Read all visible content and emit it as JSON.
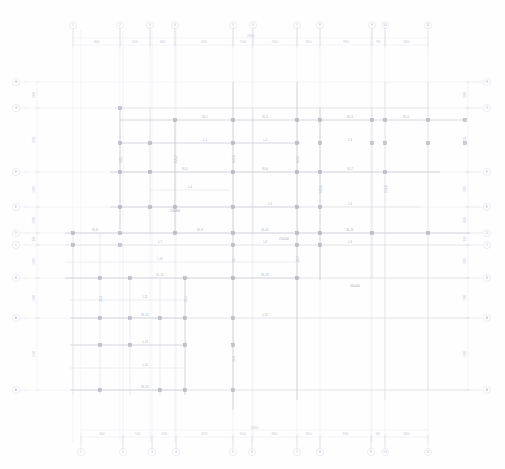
{
  "document": {
    "type": "structural-framing-plan",
    "title": "",
    "background_color": "#fefeff",
    "axis_line_color": "#e6e6ec",
    "beam_line_color": "#cfcfd8",
    "heavy_beam_color": "#b9b9c4",
    "column_color": "#9a9aa8",
    "bubble_stroke_color": "#d8d8e0",
    "dim_text_color": "#c9c9d2",
    "beam_text_color": "#a8a8b4"
  },
  "grid": {
    "top_bubbles": [
      {
        "label": "1",
        "x": 73
      },
      {
        "label": "2",
        "x": 120
      },
      {
        "label": "3",
        "x": 150
      },
      {
        "label": "4",
        "x": 175
      },
      {
        "label": "5",
        "x": 233
      },
      {
        "label": "6",
        "x": 253
      },
      {
        "label": "7",
        "x": 297
      },
      {
        "label": "8",
        "x": 320
      },
      {
        "label": "9",
        "x": 372
      },
      {
        "label": "10",
        "x": 385
      },
      {
        "label": "11",
        "x": 428
      }
    ],
    "bottom_bubbles": [
      {
        "label": "1",
        "x": 81
      },
      {
        "label": "2",
        "x": 123
      },
      {
        "label": "3",
        "x": 152
      },
      {
        "label": "4",
        "x": 176
      },
      {
        "label": "5",
        "x": 233
      },
      {
        "label": "6",
        "x": 252
      },
      {
        "label": "7",
        "x": 297
      },
      {
        "label": "8",
        "x": 320
      },
      {
        "label": "9",
        "x": 371
      },
      {
        "label": "10",
        "x": 385
      },
      {
        "label": "11",
        "x": 428
      }
    ],
    "left_bubbles": [
      {
        "label": "H",
        "y": 82
      },
      {
        "label": "G",
        "y": 108
      },
      {
        "label": "F",
        "y": 172
      },
      {
        "label": "E",
        "y": 207
      },
      {
        "label": "D",
        "y": 233
      },
      {
        "label": "C",
        "y": 245
      },
      {
        "label": "B",
        "y": 278
      },
      {
        "label": "A",
        "y": 318
      },
      {
        "label": "A",
        "y": 390
      }
    ],
    "right_bubbles": [
      {
        "label": "H",
        "y": 82
      },
      {
        "label": "G",
        "y": 108
      },
      {
        "label": "F",
        "y": 172
      },
      {
        "label": "E",
        "y": 207
      },
      {
        "label": "D",
        "y": 233
      },
      {
        "label": "C",
        "y": 245
      },
      {
        "label": "B",
        "y": 278
      },
      {
        "label": "A",
        "y": 318
      },
      {
        "label": "A",
        "y": 390
      }
    ]
  },
  "dimensions": {
    "top_chain": [
      {
        "value": "3600",
        "x1": 73,
        "x2": 120
      },
      {
        "value": "2100",
        "x1": 120,
        "x2": 150
      },
      {
        "value": "1800",
        "x1": 150,
        "x2": 175
      },
      {
        "value": "4200",
        "x1": 175,
        "x2": 233
      },
      {
        "value": "1500",
        "x1": 233,
        "x2": 253
      },
      {
        "value": "3300",
        "x1": 253,
        "x2": 297
      },
      {
        "value": "1800",
        "x1": 297,
        "x2": 320
      },
      {
        "value": "3900",
        "x1": 320,
        "x2": 372
      },
      {
        "value": "900",
        "x1": 372,
        "x2": 385
      },
      {
        "value": "3300",
        "x1": 385,
        "x2": 428
      }
    ],
    "top_overall": {
      "value": "25800",
      "x1": 73,
      "x2": 428
    },
    "bottom_chain": [
      {
        "value": "3600",
        "x1": 81,
        "x2": 123
      },
      {
        "value": "2100",
        "x1": 123,
        "x2": 152
      },
      {
        "value": "1800",
        "x1": 152,
        "x2": 176
      },
      {
        "value": "4200",
        "x1": 176,
        "x2": 233
      },
      {
        "value": "1500",
        "x1": 233,
        "x2": 252
      },
      {
        "value": "3300",
        "x1": 252,
        "x2": 297
      },
      {
        "value": "1800",
        "x1": 297,
        "x2": 320
      },
      {
        "value": "3900",
        "x1": 320,
        "x2": 371
      },
      {
        "value": "900",
        "x1": 371,
        "x2": 385
      },
      {
        "value": "3300",
        "x1": 385,
        "x2": 428
      }
    ],
    "bottom_overall": {
      "value": "25800",
      "x1": 81,
      "x2": 428
    },
    "left_chain": [
      {
        "value": "1800",
        "y1": 82,
        "y2": 108
      },
      {
        "value": "4500",
        "y1": 108,
        "y2": 172
      },
      {
        "value": "2400",
        "y1": 172,
        "y2": 207
      },
      {
        "value": "1800",
        "y1": 207,
        "y2": 233
      },
      {
        "value": "900",
        "y1": 233,
        "y2": 245
      },
      {
        "value": "2400",
        "y1": 245,
        "y2": 278
      },
      {
        "value": "2700",
        "y1": 278,
        "y2": 318
      },
      {
        "value": "5100",
        "y1": 318,
        "y2": 390
      }
    ],
    "right_chain": [
      {
        "value": "1800",
        "y1": 82,
        "y2": 108
      },
      {
        "value": "4500",
        "y1": 108,
        "y2": 172
      },
      {
        "value": "2400",
        "y1": 172,
        "y2": 207
      },
      {
        "value": "1800",
        "y1": 207,
        "y2": 233
      },
      {
        "value": "900",
        "y1": 233,
        "y2": 245
      },
      {
        "value": "2400",
        "y1": 245,
        "y2": 278
      },
      {
        "value": "2700",
        "y1": 278,
        "y2": 318
      },
      {
        "value": "5100",
        "y1": 318,
        "y2": 390
      }
    ]
  },
  "axes": {
    "vertical_x": [
      73,
      81,
      120,
      123,
      150,
      152,
      175,
      176,
      233,
      252,
      253,
      297,
      320,
      371,
      372,
      385,
      428
    ],
    "horizontal_y": [
      82,
      108,
      172,
      207,
      233,
      245,
      278,
      318,
      390
    ]
  },
  "framing": {
    "beams_h": [
      {
        "x1": 115,
        "x2": 430,
        "y": 108,
        "weight": "light"
      },
      {
        "x1": 120,
        "x2": 465,
        "y": 120,
        "weight": "medium"
      },
      {
        "x1": 120,
        "x2": 300,
        "y": 143,
        "weight": "medium"
      },
      {
        "x1": 110,
        "x2": 440,
        "y": 172,
        "weight": "medium"
      },
      {
        "x1": 150,
        "x2": 230,
        "y": 190,
        "weight": "light"
      },
      {
        "x1": 110,
        "x2": 300,
        "y": 207,
        "weight": "medium"
      },
      {
        "x1": 300,
        "x2": 420,
        "y": 207,
        "weight": "light"
      },
      {
        "x1": 65,
        "x2": 470,
        "y": 233,
        "weight": "medium"
      },
      {
        "x1": 65,
        "x2": 470,
        "y": 245,
        "weight": "light"
      },
      {
        "x1": 65,
        "x2": 300,
        "y": 262,
        "weight": "light"
      },
      {
        "x1": 65,
        "x2": 300,
        "y": 278,
        "weight": "medium"
      },
      {
        "x1": 300,
        "x2": 470,
        "y": 278,
        "weight": "light"
      },
      {
        "x1": 70,
        "x2": 185,
        "y": 300,
        "weight": "light"
      },
      {
        "x1": 70,
        "x2": 185,
        "y": 318,
        "weight": "medium"
      },
      {
        "x1": 185,
        "x2": 470,
        "y": 318,
        "weight": "light"
      },
      {
        "x1": 70,
        "x2": 185,
        "y": 345,
        "weight": "medium"
      },
      {
        "x1": 70,
        "x2": 185,
        "y": 368,
        "weight": "light"
      },
      {
        "x1": 70,
        "x2": 185,
        "y": 390,
        "weight": "medium"
      },
      {
        "x1": 185,
        "x2": 470,
        "y": 390,
        "weight": "light"
      }
    ],
    "beams_v": [
      {
        "y1": 108,
        "y2": 230,
        "x": 120,
        "weight": "medium"
      },
      {
        "y1": 108,
        "y2": 233,
        "x": 150,
        "weight": "light"
      },
      {
        "y1": 120,
        "y2": 233,
        "x": 175,
        "weight": "medium"
      },
      {
        "y1": 82,
        "y2": 410,
        "x": 233,
        "weight": "medium"
      },
      {
        "y1": 108,
        "y2": 233,
        "x": 253,
        "weight": "light"
      },
      {
        "y1": 82,
        "y2": 400,
        "x": 297,
        "weight": "medium"
      },
      {
        "y1": 108,
        "y2": 280,
        "x": 320,
        "weight": "medium"
      },
      {
        "y1": 108,
        "y2": 278,
        "x": 372,
        "weight": "light"
      },
      {
        "y1": 82,
        "y2": 400,
        "x": 385,
        "weight": "light"
      },
      {
        "y1": 82,
        "y2": 390,
        "x": 428,
        "weight": "light"
      },
      {
        "y1": 233,
        "y2": 395,
        "x": 73,
        "weight": "light"
      },
      {
        "y1": 233,
        "y2": 395,
        "x": 100,
        "weight": "light"
      },
      {
        "y1": 278,
        "y2": 395,
        "x": 130,
        "weight": "light"
      },
      {
        "y1": 278,
        "y2": 395,
        "x": 160,
        "weight": "light"
      },
      {
        "y1": 278,
        "y2": 395,
        "x": 185,
        "weight": "medium"
      }
    ],
    "columns": [
      {
        "x": 120,
        "y": 108
      },
      {
        "x": 175,
        "y": 120
      },
      {
        "x": 233,
        "y": 120
      },
      {
        "x": 297,
        "y": 120
      },
      {
        "x": 320,
        "y": 120
      },
      {
        "x": 372,
        "y": 120
      },
      {
        "x": 385,
        "y": 120
      },
      {
        "x": 428,
        "y": 120
      },
      {
        "x": 465,
        "y": 120
      },
      {
        "x": 120,
        "y": 143
      },
      {
        "x": 150,
        "y": 143
      },
      {
        "x": 233,
        "y": 143
      },
      {
        "x": 297,
        "y": 143
      },
      {
        "x": 320,
        "y": 143
      },
      {
        "x": 372,
        "y": 143
      },
      {
        "x": 385,
        "y": 143
      },
      {
        "x": 428,
        "y": 143
      },
      {
        "x": 465,
        "y": 143
      },
      {
        "x": 120,
        "y": 172
      },
      {
        "x": 150,
        "y": 172
      },
      {
        "x": 233,
        "y": 172
      },
      {
        "x": 297,
        "y": 172
      },
      {
        "x": 320,
        "y": 172
      },
      {
        "x": 385,
        "y": 172
      },
      {
        "x": 120,
        "y": 207
      },
      {
        "x": 150,
        "y": 207
      },
      {
        "x": 175,
        "y": 207
      },
      {
        "x": 233,
        "y": 207
      },
      {
        "x": 297,
        "y": 207
      },
      {
        "x": 320,
        "y": 207
      },
      {
        "x": 73,
        "y": 233
      },
      {
        "x": 120,
        "y": 233
      },
      {
        "x": 175,
        "y": 233
      },
      {
        "x": 233,
        "y": 233
      },
      {
        "x": 297,
        "y": 233
      },
      {
        "x": 320,
        "y": 233
      },
      {
        "x": 372,
        "y": 233
      },
      {
        "x": 428,
        "y": 233
      },
      {
        "x": 73,
        "y": 245
      },
      {
        "x": 120,
        "y": 245
      },
      {
        "x": 233,
        "y": 245
      },
      {
        "x": 297,
        "y": 245
      },
      {
        "x": 320,
        "y": 245
      },
      {
        "x": 100,
        "y": 278
      },
      {
        "x": 130,
        "y": 278
      },
      {
        "x": 185,
        "y": 278
      },
      {
        "x": 233,
        "y": 278
      },
      {
        "x": 297,
        "y": 278
      },
      {
        "x": 100,
        "y": 318
      },
      {
        "x": 130,
        "y": 318
      },
      {
        "x": 160,
        "y": 318
      },
      {
        "x": 185,
        "y": 318
      },
      {
        "x": 233,
        "y": 318
      },
      {
        "x": 100,
        "y": 345
      },
      {
        "x": 130,
        "y": 345
      },
      {
        "x": 185,
        "y": 345
      },
      {
        "x": 233,
        "y": 345
      },
      {
        "x": 100,
        "y": 390
      },
      {
        "x": 160,
        "y": 390
      },
      {
        "x": 185,
        "y": 390
      },
      {
        "x": 233,
        "y": 390
      }
    ],
    "beam_labels": [
      {
        "text": "KL-1",
        "x": 205,
        "y": 119,
        "rot": 0
      },
      {
        "text": "KL-2",
        "x": 265,
        "y": 119,
        "rot": 0
      },
      {
        "text": "KL-3",
        "x": 350,
        "y": 119,
        "rot": 0
      },
      {
        "text": "KL-4",
        "x": 406,
        "y": 119,
        "rot": 0
      },
      {
        "text": "L-1",
        "x": 205,
        "y": 142,
        "rot": 0
      },
      {
        "text": "L-2",
        "x": 265,
        "y": 142,
        "rot": 0
      },
      {
        "text": "L-3",
        "x": 350,
        "y": 142,
        "rot": 0
      },
      {
        "text": "KL-5",
        "x": 185,
        "y": 171,
        "rot": 0
      },
      {
        "text": "KL-6",
        "x": 265,
        "y": 171,
        "rot": 0
      },
      {
        "text": "KL-7",
        "x": 350,
        "y": 171,
        "rot": 0
      },
      {
        "text": "L-4",
        "x": 190,
        "y": 189,
        "rot": 0
      },
      {
        "text": "L-5",
        "x": 270,
        "y": 206,
        "rot": 0
      },
      {
        "text": "L-6",
        "x": 350,
        "y": 206,
        "rot": 0
      },
      {
        "text": "KL-8",
        "x": 95,
        "y": 232,
        "rot": 0
      },
      {
        "text": "KL-9",
        "x": 200,
        "y": 232,
        "rot": 0
      },
      {
        "text": "KL-10",
        "x": 265,
        "y": 232,
        "rot": 0
      },
      {
        "text": "KL-11",
        "x": 350,
        "y": 232,
        "rot": 0
      },
      {
        "text": "L-7",
        "x": 160,
        "y": 244,
        "rot": 0
      },
      {
        "text": "L-8",
        "x": 265,
        "y": 244,
        "rot": 0
      },
      {
        "text": "L-9",
        "x": 350,
        "y": 244,
        "rot": 0
      },
      {
        "text": "L-10",
        "x": 160,
        "y": 261,
        "rot": 0
      },
      {
        "text": "KL-12",
        "x": 160,
        "y": 277,
        "rot": 0
      },
      {
        "text": "KL-13",
        "x": 265,
        "y": 277,
        "rot": 0
      },
      {
        "text": "L-11",
        "x": 145,
        "y": 299,
        "rot": 0
      },
      {
        "text": "KL-14",
        "x": 145,
        "y": 317,
        "rot": 0
      },
      {
        "text": "L-12",
        "x": 265,
        "y": 317,
        "rot": 0
      },
      {
        "text": "L-13",
        "x": 145,
        "y": 344,
        "rot": 0
      },
      {
        "text": "L-14",
        "x": 145,
        "y": 367,
        "rot": 0
      },
      {
        "text": "KL-15",
        "x": 145,
        "y": 389,
        "rot": 0
      },
      {
        "text": "KZL-1",
        "x": 122,
        "y": 160,
        "rot": -90
      },
      {
        "text": "KZL-2",
        "x": 177,
        "y": 160,
        "rot": -90
      },
      {
        "text": "KZL-3",
        "x": 235,
        "y": 160,
        "rot": -90
      },
      {
        "text": "KZL-4",
        "x": 299,
        "y": 160,
        "rot": -90
      },
      {
        "text": "KZL-5",
        "x": 322,
        "y": 190,
        "rot": -90
      },
      {
        "text": "KZL-6",
        "x": 387,
        "y": 190,
        "rot": -90
      },
      {
        "text": "ZL-1",
        "x": 235,
        "y": 260,
        "rot": -90
      },
      {
        "text": "ZL-2",
        "x": 299,
        "y": 260,
        "rot": -90
      },
      {
        "text": "ZL-3",
        "x": 102,
        "y": 300,
        "rot": -90
      },
      {
        "text": "ZL-4",
        "x": 187,
        "y": 300,
        "rot": -90
      },
      {
        "text": "ZL-5",
        "x": 235,
        "y": 360,
        "rot": -90
      },
      {
        "text": "250x500",
        "x": 284,
        "y": 241,
        "rot": 0
      },
      {
        "text": "250x600",
        "x": 175,
        "y": 213,
        "rot": 0
      },
      {
        "text": "200x400",
        "x": 355,
        "y": 288,
        "rot": 0
      }
    ]
  }
}
